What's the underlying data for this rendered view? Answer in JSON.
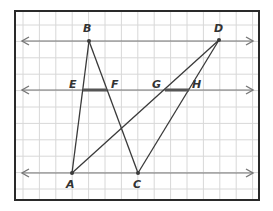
{
  "diagram": {
    "type": "geometry",
    "frame": {
      "x": 15,
      "y": 11,
      "width": 244,
      "height": 189
    },
    "grid": {
      "x0": 23,
      "y0": 11,
      "step": 16.4
    },
    "colors": {
      "line": "#3a3a3a",
      "grid": "#d8d8d8",
      "parallel": "#777777",
      "segment": "#555555",
      "frame": "#2a2a2a"
    },
    "parallel_lines": [
      {
        "name": "top-line",
        "y": 41,
        "x1": 22,
        "x2": 253
      },
      {
        "name": "middle-line",
        "y": 90,
        "x1": 22,
        "x2": 253
      },
      {
        "name": "bottom-line",
        "y": 173,
        "x1": 22,
        "x2": 253
      }
    ],
    "points": {
      "A": {
        "x": 72,
        "y": 173,
        "label": "A",
        "lx": 66,
        "ly": 188
      },
      "B": {
        "x": 89,
        "y": 41,
        "label": "B",
        "lx": 83,
        "ly": 32
      },
      "C": {
        "x": 138,
        "y": 173,
        "label": "C",
        "lx": 133,
        "ly": 188
      },
      "D": {
        "x": 219,
        "y": 40,
        "label": "D",
        "lx": 214,
        "ly": 32
      },
      "E": {
        "x": 83,
        "y": 90,
        "label": "E",
        "lx": 69,
        "ly": 88
      },
      "F": {
        "x": 107,
        "y": 90,
        "label": "F",
        "lx": 111,
        "ly": 88
      },
      "G": {
        "x": 165,
        "y": 90,
        "label": "G",
        "lx": 152,
        "ly": 88
      },
      "H": {
        "x": 189,
        "y": 90,
        "label": "H",
        "lx": 192,
        "ly": 88
      }
    },
    "segments": [
      {
        "from": "A",
        "to": "B"
      },
      {
        "from": "B",
        "to": "C"
      },
      {
        "from": "A",
        "to": "D"
      },
      {
        "from": "C",
        "to": "D"
      }
    ],
    "highlighted_segments": [
      {
        "from": "E",
        "to": "F"
      },
      {
        "from": "G",
        "to": "H"
      }
    ]
  }
}
